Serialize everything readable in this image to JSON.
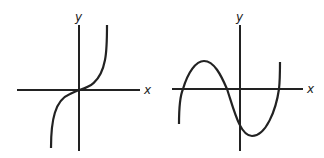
{
  "figure": {
    "panels": [
      {
        "name": "cubic-monotonic",
        "x_label": "x",
        "y_label": "y",
        "description": "Monotonically increasing cubic curve passing through the origin with an inflection point there"
      },
      {
        "name": "cubic-three-roots",
        "x_label": "x",
        "y_label": "y",
        "description": "Cubic curve with a local maximum left of the y-axis and a local minimum right of it, crossing the x-axis three times"
      }
    ],
    "colors": {
      "line": "#222222",
      "background": "#ffffff"
    }
  }
}
